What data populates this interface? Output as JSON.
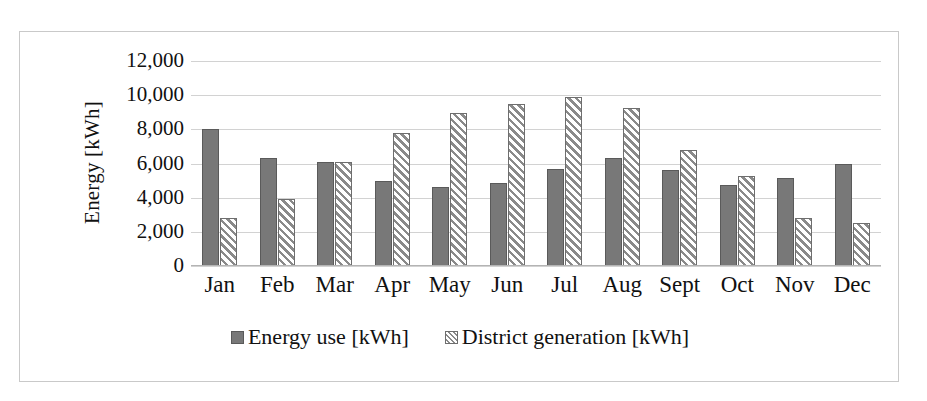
{
  "chart_data": {
    "type": "bar",
    "title": "",
    "xlabel": "",
    "ylabel": "Energy [kWh]",
    "ylim": [
      0,
      12000
    ],
    "ytick_step": 2000,
    "ytick_labels": [
      "12,000",
      "10,000",
      "8,000",
      "6,000",
      "4,000",
      "2,000",
      "0"
    ],
    "ytick_values": [
      12000,
      10000,
      8000,
      6000,
      4000,
      2000,
      0
    ],
    "grid": true,
    "legend_position": "bottom",
    "categories": [
      "Jan",
      "Feb",
      "Mar",
      "Apr",
      "May",
      "Jun",
      "Jul",
      "Aug",
      "Sept",
      "Oct",
      "Nov",
      "Dec"
    ],
    "series": [
      {
        "name": "Energy use [kWh]",
        "style": "solid",
        "color": "#787878",
        "values": [
          8000,
          6350,
          6100,
          5000,
          4650,
          4850,
          5700,
          6350,
          5600,
          4750,
          5150,
          5950
        ]
      },
      {
        "name": "District generation [kWh]",
        "style": "hatched",
        "color": "#8a8a8a",
        "values": [
          2800,
          3950,
          6100,
          7800,
          8950,
          9500,
          9900,
          9250,
          6800,
          5250,
          2800,
          2500
        ]
      }
    ]
  },
  "legend": {
    "items": [
      {
        "label": "Energy use [kWh]",
        "swatch": "solid-gray-square"
      },
      {
        "label": "District generation [kWh]",
        "swatch": "hatched-square"
      }
    ]
  },
  "axes": {
    "y_title": "Energy [kWh]"
  }
}
